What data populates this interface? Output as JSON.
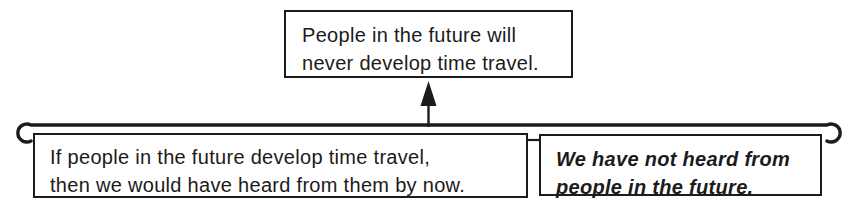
{
  "colors": {
    "ink": "#1b1b1b",
    "background": "#ffffff"
  },
  "conclusion_box": {
    "lines": [
      "People in the future will",
      "never develop time travel."
    ]
  },
  "premise_left_box": {
    "lines": [
      "If people in the future develop time travel,",
      "then we would have heard from them by now."
    ]
  },
  "premise_right_box": {
    "lines": [
      "We have not heard from",
      "people in the future."
    ]
  }
}
